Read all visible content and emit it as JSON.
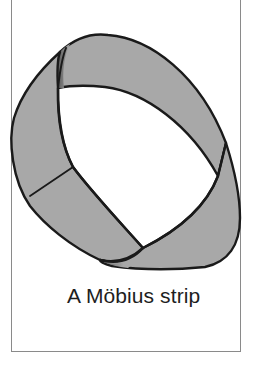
{
  "figure": {
    "caption": "A Möbius strip",
    "colors": {
      "strip_fill": "#a8a8a8",
      "outline": "#1a1a1a",
      "frame_border": "#8a8a8a",
      "background": "#ffffff"
    }
  }
}
